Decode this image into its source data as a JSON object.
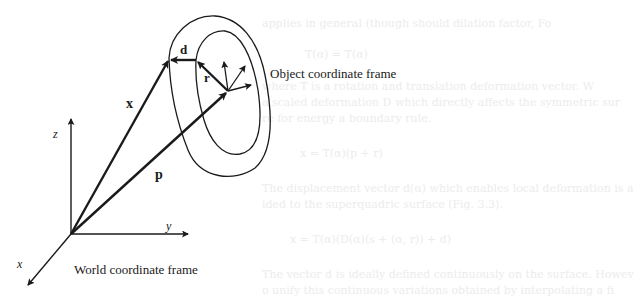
{
  "figure": {
    "labels": {
      "vector_d": "d",
      "vector_r": "r",
      "vector_x": "x",
      "vector_p": "p",
      "axis_z": "z",
      "axis_y": "y",
      "axis_x": "x",
      "object_frame": "Object coordinate frame",
      "world_frame": "World coordinate frame"
    },
    "colors": {
      "stroke": "#1a1a1a",
      "background": "#ffffff",
      "ghost_text": "#ececec"
    }
  },
  "ghost_text": {
    "lines": [
      "applies in general (though should dilation factor, Fo",
      "T(α) = T(α)",
      "where T is a rotation and translation deformation vector. W",
      "a scaled deformation D which directly affects the symmetric sur",
      "re for energy a boundary rule.",
      "x = T(α)(p + r)",
      "The displacement vector d(α) which enables local deformation is a",
      "ided to the superquadric surface (Fig. 3.3).",
      "x = T(α)(D(α)(s + (α, r)) + d)",
      "The vector d is ideally defined continuously on the surface. Howev",
      "o unify this continuous variations obtained by interpolating a fi"
    ]
  }
}
